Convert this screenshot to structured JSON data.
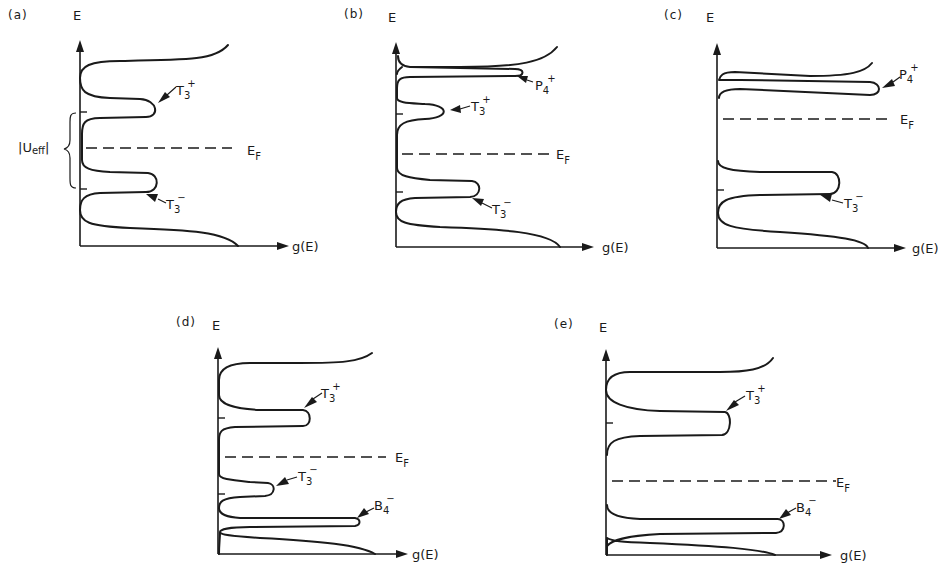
{
  "figure": {
    "axis_labels": {
      "y": "E",
      "x": "g(E)"
    },
    "fermi_label": {
      "main": "E",
      "sub": "F"
    },
    "panels": [
      {
        "id": "a",
        "tag": "(a)",
        "states": [
          {
            "name": "T3+",
            "main": "T",
            "sub": "3",
            "sup": "+"
          },
          {
            "name": "T3-",
            "main": "T",
            "sub": "3",
            "sup": "−"
          }
        ],
        "annotation": {
          "main": "|U",
          "sub": "eff",
          "tail": "|"
        }
      },
      {
        "id": "b",
        "tag": "(b)",
        "states": [
          {
            "name": "P4+",
            "main": "P",
            "sub": "4",
            "sup": "+"
          },
          {
            "name": "T3+",
            "main": "T",
            "sub": "3",
            "sup": "+"
          },
          {
            "name": "T3-",
            "main": "T",
            "sub": "3",
            "sup": "−"
          }
        ]
      },
      {
        "id": "c",
        "tag": "(c)",
        "states": [
          {
            "name": "P4+",
            "main": "P",
            "sub": "4",
            "sup": "+"
          },
          {
            "name": "T3-",
            "main": "T",
            "sub": "3",
            "sup": "−"
          }
        ]
      },
      {
        "id": "d",
        "tag": "(d)",
        "states": [
          {
            "name": "T3+",
            "main": "T",
            "sub": "3",
            "sup": "+"
          },
          {
            "name": "T3-",
            "main": "T",
            "sub": "3",
            "sup": "−"
          },
          {
            "name": "B4-",
            "main": "B",
            "sub": "4",
            "sup": "−"
          }
        ]
      },
      {
        "id": "e",
        "tag": "(e)",
        "states": [
          {
            "name": "T3+",
            "main": "T",
            "sub": "3",
            "sup": "+"
          },
          {
            "name": "B4-",
            "main": "B",
            "sub": "4",
            "sup": "−"
          }
        ]
      }
    ]
  }
}
